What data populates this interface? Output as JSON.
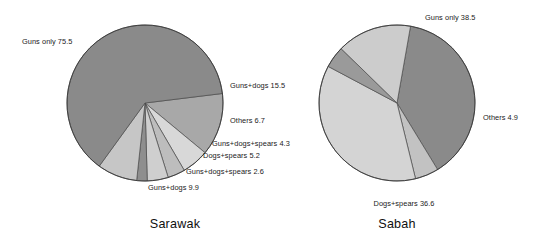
{
  "figure": {
    "background_color": "#ffffff",
    "text_color": "#1a1a1a",
    "charts": [
      {
        "caption": "Sarawak",
        "caption_x": 175,
        "caption_y": 228,
        "center_x": 145,
        "center_y": 103,
        "radius": 78
      },
      {
        "caption": "Sabah",
        "caption_x": 397,
        "caption_y": 228,
        "center_x": 397,
        "center_y": 103,
        "radius": 78
      }
    ]
  },
  "chart_data": [
    {
      "type": "pie",
      "title": "Sarawak",
      "unit": "percent",
      "start_angle_deg": -7,
      "direction": "clockwise",
      "categories": [
        "Guns+dogs",
        "Others",
        "Guns+dogs+spears",
        "Dogs+spears",
        "Guns+dogs+spears",
        "Guns+dogs",
        "Guns only"
      ],
      "values": [
        15.5,
        6.7,
        4.3,
        5.2,
        2.6,
        9.9,
        75.5
      ],
      "labels": [
        "Guns+dogs 15.5",
        "Others 6.7",
        "Guns+dogs+spears 4.3",
        "Dogs+spears 5.2",
        "Guns+dogs+spears 2.6",
        "Guns+dogs 9.9",
        "Guns only 75.5"
      ],
      "colors": [
        "#a8a8a8",
        "#d8d8d8",
        "#bdbdbd",
        "#cfcfcf",
        "#8e8e8e",
        "#c6c6c6",
        "#8a8a8a"
      ],
      "legend": "none",
      "label_positions": [
        {
          "text": "Guns only 75.5",
          "x": 22,
          "y": 44,
          "anchor": "start"
        },
        {
          "text": "Guns+dogs 15.5",
          "x": 230,
          "y": 88,
          "anchor": "start"
        },
        {
          "text": "Others 6.7",
          "x": 230,
          "y": 123,
          "anchor": "start"
        },
        {
          "text": "Guns+dogs+spears 4.3",
          "x": 212,
          "y": 146,
          "anchor": "start"
        },
        {
          "text": "Dogs+spears 5.2",
          "x": 203,
          "y": 158,
          "anchor": "start"
        },
        {
          "text": "Guns+dogs+spears 2.6",
          "x": 186,
          "y": 174,
          "anchor": "start"
        },
        {
          "text": "Guns+dogs 9.9",
          "x": 148,
          "y": 190,
          "anchor": "start"
        }
      ]
    },
    {
      "type": "pie",
      "title": "Sabah",
      "unit": "percent",
      "start_angle_deg": -80,
      "direction": "clockwise",
      "categories": [
        "Guns only",
        "Others",
        "Dogs+spears",
        "Guns+dogs+spears",
        "Guns+dogs"
      ],
      "values": [
        38.5,
        4.9,
        36.6,
        4.5,
        15.5
      ],
      "labels": [
        "Guns only 38.5",
        "Others 4.9",
        "Dogs+spears 36.6",
        "",
        ""
      ],
      "colors": [
        "#8a8a8a",
        "#c2c2c2",
        "#d4d4d4",
        "#9a9a9a",
        "#cccccc"
      ],
      "legend": "none",
      "label_positions": [
        {
          "text": "Guns only 38.5",
          "x": 425,
          "y": 20,
          "anchor": "start"
        },
        {
          "text": "Others 4.9",
          "x": 483,
          "y": 120,
          "anchor": "start"
        },
        {
          "text": "Dogs+spears 36.6",
          "x": 404,
          "y": 206,
          "anchor": "middle"
        }
      ]
    }
  ]
}
